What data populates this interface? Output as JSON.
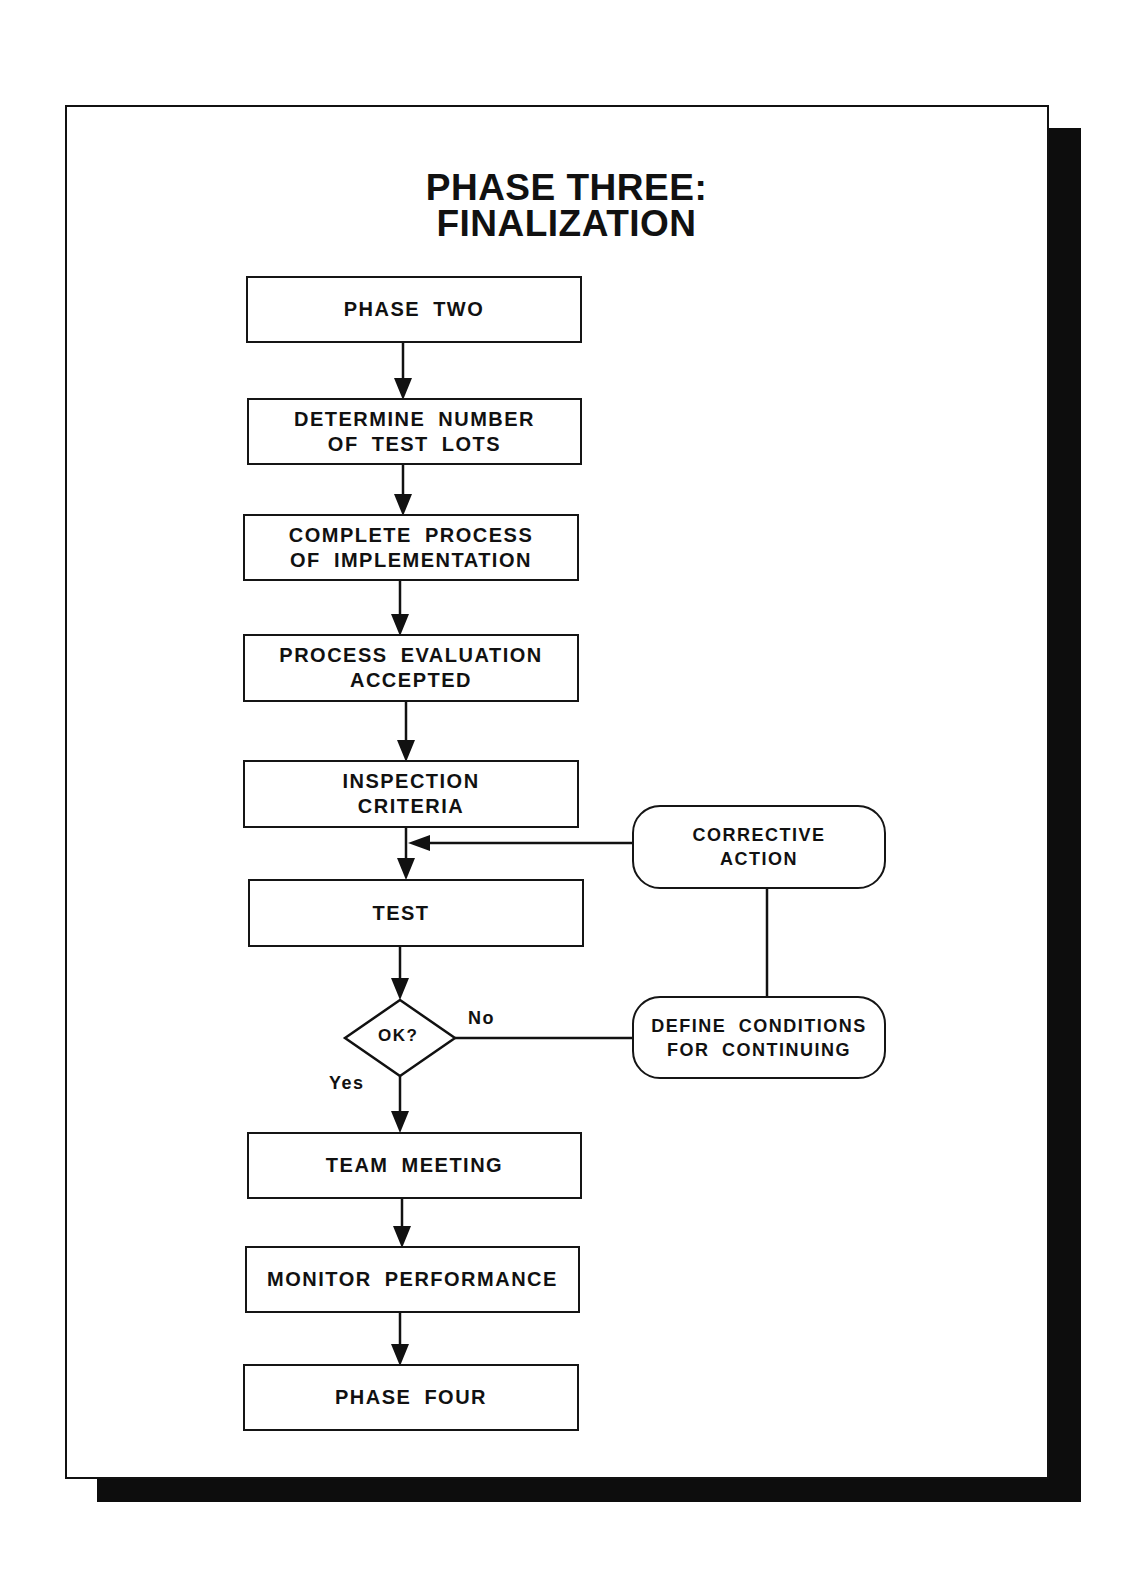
{
  "diagram": {
    "title_line1": "PHASE THREE:",
    "title_line2": "FINALIZATION",
    "nodes": [
      {
        "id": "phase-two",
        "type": "process",
        "lines": [
          "PHASE TWO"
        ]
      },
      {
        "id": "determine-test-lots",
        "type": "process",
        "lines": [
          "DETERMINE NUMBER",
          "OF TEST LOTS"
        ]
      },
      {
        "id": "complete-process",
        "type": "process",
        "lines": [
          "COMPLETE PROCESS",
          "OF IMPLEMENTATION"
        ]
      },
      {
        "id": "process-evaluation",
        "type": "process",
        "lines": [
          "PROCESS EVALUATION",
          "ACCEPTED"
        ]
      },
      {
        "id": "inspection-criteria",
        "type": "process",
        "lines": [
          "INSPECTION",
          "CRITERIA"
        ]
      },
      {
        "id": "test",
        "type": "process",
        "lines": [
          "TEST"
        ]
      },
      {
        "id": "ok-decision",
        "type": "decision",
        "lines": [
          "OK?"
        ]
      },
      {
        "id": "team-meeting",
        "type": "process",
        "lines": [
          "TEAM MEETING"
        ]
      },
      {
        "id": "monitor-performance",
        "type": "process",
        "lines": [
          "MONITOR PERFORMANCE"
        ]
      },
      {
        "id": "phase-four",
        "type": "process",
        "lines": [
          "PHASE FOUR"
        ]
      },
      {
        "id": "corrective-action",
        "type": "terminal",
        "lines": [
          "CORRECTIVE",
          "ACTION"
        ]
      },
      {
        "id": "define-conditions",
        "type": "terminal",
        "lines": [
          "DEFINE CONDITIONS",
          "FOR CONTINUING"
        ]
      }
    ],
    "edge_labels": {
      "no": "No",
      "yes": "Yes"
    },
    "edges": [
      {
        "from": "phase-two",
        "to": "determine-test-lots"
      },
      {
        "from": "determine-test-lots",
        "to": "complete-process"
      },
      {
        "from": "complete-process",
        "to": "process-evaluation"
      },
      {
        "from": "process-evaluation",
        "to": "inspection-criteria"
      },
      {
        "from": "inspection-criteria",
        "to": "test"
      },
      {
        "from": "test",
        "to": "ok-decision"
      },
      {
        "from": "ok-decision",
        "to": "team-meeting",
        "label": "Yes"
      },
      {
        "from": "ok-decision",
        "to": "define-conditions",
        "label": "No"
      },
      {
        "from": "define-conditions",
        "to": "corrective-action"
      },
      {
        "from": "corrective-action",
        "to": "test"
      },
      {
        "from": "team-meeting",
        "to": "monitor-performance"
      },
      {
        "from": "monitor-performance",
        "to": "phase-four"
      }
    ],
    "colors": {
      "ink": "#111111",
      "paper": "#ffffff",
      "shadow": "#0d0d0d"
    }
  }
}
